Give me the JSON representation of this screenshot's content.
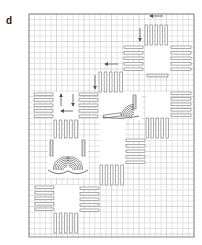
{
  "panel": {
    "label": "d"
  },
  "colors": {
    "grid_minor": "#d4d4d4",
    "grid_major": "#bdbdbd",
    "border": "#8a8a8a",
    "bar_stroke": "#8c8c8c",
    "bar_fill": "#ffffff",
    "arrow": "#555555",
    "garment_stroke": "#555555"
  },
  "frame": {
    "x": 29,
    "y": 14,
    "w": 165,
    "h": 223,
    "cell": 5.5,
    "major_every": 5
  },
  "white_squares": [
    {
      "name": "square-top-right",
      "x": 145,
      "y": 45,
      "w": 25,
      "h": 29
    },
    {
      "name": "square-middle",
      "x": 99,
      "y": 92,
      "w": 43,
      "h": 28
    },
    {
      "name": "square-left",
      "x": 54,
      "y": 92,
      "w": 25,
      "h": 28
    },
    {
      "name": "square-center-left",
      "x": 48,
      "y": 138,
      "w": 40,
      "h": 40
    },
    {
      "name": "square-right-middle",
      "x": 146,
      "y": 92,
      "w": 24,
      "h": 26
    },
    {
      "name": "square-center",
      "x": 100,
      "y": 120,
      "w": 25,
      "h": 45
    },
    {
      "name": "square-bottom-left",
      "x": 54,
      "y": 185,
      "w": 26,
      "h": 28
    }
  ],
  "bar_groups": [
    {
      "name": "top-right-vertical-bars",
      "orient": "v",
      "x": 145,
      "y": 25,
      "len": 20,
      "count": 5,
      "step": 5
    },
    {
      "name": "top-right-left-horizontal-bars",
      "orient": "h",
      "x": 124,
      "y": 46,
      "len": 19,
      "count": 5,
      "step": 5.5
    },
    {
      "name": "top-right-right-horizontal-bars",
      "orient": "h",
      "x": 171,
      "y": 46,
      "len": 20,
      "count": 5,
      "step": 5.5
    },
    {
      "name": "top-right-bottom-strip",
      "orient": "h",
      "x": 147,
      "y": 74,
      "len": 21,
      "count": 1,
      "step": 0,
      "thick": 3
    },
    {
      "name": "middle-vertical-bars",
      "orient": "v",
      "x": 99,
      "y": 72,
      "len": 20,
      "count": 5,
      "step": 5.2
    },
    {
      "name": "middle-left-horizontal-bars",
      "orient": "h",
      "x": 79,
      "y": 93,
      "len": 19,
      "count": 5,
      "step": 5.5
    },
    {
      "name": "right-middle-horizontal-bars",
      "orient": "h",
      "x": 171,
      "y": 92,
      "len": 20,
      "count": 5,
      "step": 5.5
    },
    {
      "name": "left-horizontal-bars",
      "orient": "h",
      "x": 34,
      "y": 93,
      "len": 19,
      "count": 5,
      "step": 5.5
    },
    {
      "name": "left-vertical-bars",
      "orient": "v",
      "x": 54,
      "y": 120,
      "len": 18,
      "count": 5,
      "step": 5.2
    },
    {
      "name": "right-lower-vertical-bars",
      "orient": "v",
      "x": 146,
      "y": 118,
      "len": 20,
      "count": 5,
      "step": 5
    },
    {
      "name": "center-horizontal-bars",
      "orient": "h",
      "x": 126,
      "y": 139,
      "len": 19,
      "count": 5,
      "step": 5.5
    },
    {
      "name": "center-vertical-bars",
      "orient": "v",
      "x": 100,
      "y": 165,
      "len": 20,
      "count": 5,
      "step": 5.2
    },
    {
      "name": "bottom-left-horizontal-bars",
      "orient": "h",
      "x": 35,
      "y": 186,
      "len": 19,
      "count": 5,
      "step": 5.5
    },
    {
      "name": "bottom-right-horizontal-bars",
      "orient": "h",
      "x": 80,
      "y": 187,
      "len": 19,
      "count": 5,
      "step": 5.5
    },
    {
      "name": "bottom-vertical-bars",
      "orient": "v",
      "x": 54,
      "y": 213,
      "len": 20,
      "count": 5,
      "step": 5.2
    }
  ],
  "arrows": [
    {
      "name": "arrow-top-left",
      "x1": 163,
      "y1": 16,
      "x2": 150,
      "y2": 16
    },
    {
      "name": "arrow-top-down",
      "x1": 140,
      "y1": 28,
      "x2": 140,
      "y2": 41
    },
    {
      "name": "arrow-middle-left",
      "x1": 118,
      "y1": 64,
      "x2": 105,
      "y2": 64
    },
    {
      "name": "arrow-middle-down",
      "x1": 95,
      "y1": 75,
      "x2": 95,
      "y2": 89
    },
    {
      "name": "arrow-left-up",
      "x1": 61,
      "y1": 106,
      "x2": 61,
      "y2": 94
    },
    {
      "name": "arrow-left-down",
      "x1": 73,
      "y1": 94,
      "x2": 73,
      "y2": 106
    },
    {
      "name": "arrow-left-left",
      "x1": 73,
      "y1": 111,
      "x2": 61,
      "y2": 111
    }
  ],
  "garments": [
    {
      "name": "full-bra",
      "x": 48,
      "y": 140,
      "w": 40,
      "h": 35
    },
    {
      "name": "half-bra",
      "x": 101,
      "y": 95,
      "w": 40,
      "h": 24
    }
  ]
}
